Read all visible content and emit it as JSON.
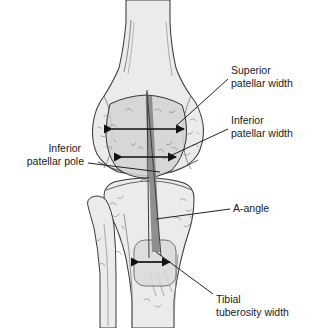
{
  "figure": {
    "view": "anterior knee radiographic schematic"
  },
  "colors": {
    "background": "#ffffff",
    "bone_fill": "#ebebeb",
    "bone_outline": "#3a3a3a",
    "patella_fill": "#d4d4d4",
    "patella_outline": "#333333",
    "tuberosity_fill": "#d9d9d9",
    "angle_wedge_fill": "#8a8a8a",
    "arrow_color": "#111111",
    "leader_color": "#222222",
    "text_color": "#1a1a1a",
    "texture_mark": "#8d8d8d"
  },
  "labels": [
    {
      "id": "superior-patellar-width",
      "lines": [
        "Superior",
        "patellar width"
      ],
      "text_x": 231,
      "text_y": 74,
      "anchor": "start",
      "leader": {
        "x1": 228,
        "y1": 79,
        "x2": 176,
        "y2": 126
      }
    },
    {
      "id": "inferior-patellar-width",
      "lines": [
        "Inferior",
        "patellar width"
      ],
      "text_x": 231,
      "text_y": 124,
      "anchor": "start",
      "leader": {
        "x1": 228,
        "y1": 129,
        "x2": 172,
        "y2": 155
      }
    },
    {
      "id": "inferior-patellar-pole",
      "lines": [
        "Inferior",
        "patellar pole"
      ],
      "text_x": 84,
      "text_y": 152,
      "anchor": "end",
      "leader": {
        "x1": 88,
        "y1": 163,
        "x2": 160,
        "y2": 172
      }
    },
    {
      "id": "a-angle",
      "lines": [
        "A-angle"
      ],
      "text_x": 233,
      "text_y": 212,
      "anchor": "start",
      "leader": {
        "x1": 230,
        "y1": 209,
        "x2": 156,
        "y2": 219
      }
    },
    {
      "id": "tibial-tuberosity-width",
      "lines": [
        "Tibial",
        "tuberosity width"
      ],
      "text_x": 216,
      "text_y": 303,
      "anchor": "start",
      "leader": {
        "x1": 213,
        "y1": 294,
        "x2": 156,
        "y2": 252
      }
    }
  ],
  "measurements": [
    {
      "id": "superior-patellar-width-arrow",
      "name": "superior patellar width",
      "type": "double-headed-arrow",
      "x1": 112,
      "x2": 184,
      "y": 129
    },
    {
      "id": "inferior-patellar-width-arrow",
      "name": "inferior patellar width",
      "type": "double-headed-arrow",
      "x1": 122,
      "x2": 176,
      "y": 157
    },
    {
      "id": "tibial-tuberosity-width-arrow",
      "name": "tibial tuberosity width",
      "type": "double-headed-arrow",
      "x1": 139,
      "x2": 170,
      "y": 262
    }
  ],
  "structures": [
    {
      "id": "femur",
      "name": "femur"
    },
    {
      "id": "patella",
      "name": "patella"
    },
    {
      "id": "tibia",
      "name": "tibia"
    },
    {
      "id": "fibula",
      "name": "fibula"
    },
    {
      "id": "tibial-tuberosity",
      "name": "tibial tuberosity"
    },
    {
      "id": "a-angle-wedge",
      "name": "A-angle wedge"
    }
  ]
}
